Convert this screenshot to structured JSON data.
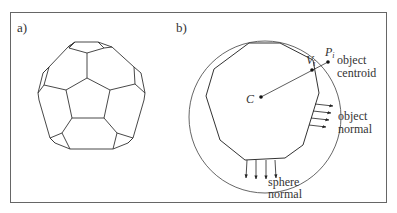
{
  "panels": [
    {
      "id": "a",
      "label": "a)",
      "description": "truncated icosahedron (soccer ball) wireframe"
    },
    {
      "id": "b",
      "label": "b)",
      "labels": {
        "center": "C",
        "vertex": "V",
        "vertex_sub": "i",
        "point": "P",
        "point_sub": "i",
        "object_centroid_line1": "object",
        "object_centroid_line2": "centroid",
        "object_normal_line1": "object",
        "object_normal_line2": "normal",
        "sphere_normal_line1": "sphere",
        "sphere_normal_line2": "normal"
      }
    }
  ],
  "colors": {
    "line": "#333333",
    "border": "#666666",
    "background": "#ffffff"
  }
}
